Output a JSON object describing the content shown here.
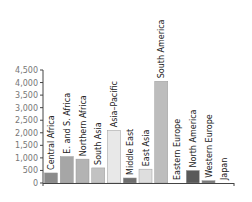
{
  "chart_data": {
    "type": "bar",
    "title": "",
    "xlabel": "",
    "ylabel": "",
    "ylim": [
      0,
      4500
    ],
    "yticks": [
      0,
      500,
      1000,
      1500,
      2000,
      2500,
      3000,
      3500,
      4000,
      4500
    ],
    "ytick_labels": [
      "0",
      "500",
      "1,000",
      "1,500",
      "2,000",
      "2,500",
      "3,000",
      "3,500",
      "4,000",
      "4,500"
    ],
    "grid": false,
    "legend": null,
    "categories": [
      "Central Africa",
      "E. and S. Africa",
      "Northern Africa",
      "South Asia",
      "Asia–Pacific",
      "Middle East",
      "East Asia",
      "South America",
      "Eastern Europe",
      "North America",
      "Western Europe",
      "Japan"
    ],
    "values": [
      400,
      1050,
      950,
      600,
      2100,
      200,
      550,
      4050,
      0,
      500,
      90,
      0
    ],
    "colors": [
      "#8c8c8c",
      "#a6a6a6",
      "#b3b3b3",
      "#c2c2c2",
      "#e8e8e8",
      "#6e6e6e",
      "#dedede",
      "#bdbdbd",
      "#d9d9d9",
      "#595959",
      "#7a7a7a",
      "#9e9e9e"
    ]
  }
}
